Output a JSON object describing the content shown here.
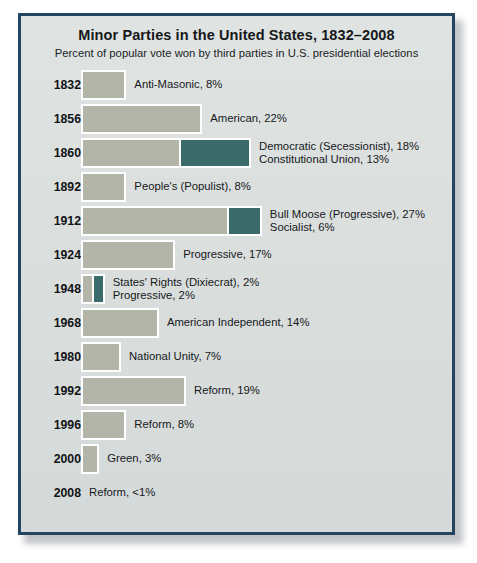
{
  "chart_data": {
    "type": "bar",
    "title": "Minor Parties in the United States, 1832–2008",
    "subtitle": "Percent of popular vote won by third parties in U.S. presidential elections",
    "xlabel": "",
    "ylabel": "",
    "orientation": "horizontal",
    "stacked": true,
    "grid": false,
    "legend": "none",
    "value_unit": "%",
    "xlim": [
      0,
      31
    ],
    "colors": {
      "primary_bar": "#b2b5a8",
      "secondary_bar": "#3a6a6a",
      "panel_background": "#dde2e1",
      "panel_border": "#24455f",
      "text": "#16181a"
    },
    "categories": [
      "1832",
      "1856",
      "1860",
      "1892",
      "1912",
      "1924",
      "1948",
      "1968",
      "1980",
      "1992",
      "1996",
      "2000",
      "2008"
    ],
    "rows": [
      {
        "year": "1832",
        "segments": [
          {
            "party": "Anti-Masonic",
            "value": 8,
            "color": "gray"
          }
        ],
        "labels": [
          "Anti-Masonic, 8%"
        ]
      },
      {
        "year": "1856",
        "segments": [
          {
            "party": "American",
            "value": 22,
            "color": "gray"
          }
        ],
        "labels": [
          "American, 22%"
        ]
      },
      {
        "year": "1860",
        "segments": [
          {
            "party": "Democratic (Secessionist)",
            "value": 18,
            "color": "gray"
          },
          {
            "party": "Constitutional Union",
            "value": 13,
            "color": "teal"
          }
        ],
        "labels": [
          "Democratic (Secessionist), 18%",
          "Constitutional Union, 13%"
        ]
      },
      {
        "year": "1892",
        "segments": [
          {
            "party": "People's (Populist)",
            "value": 8,
            "color": "gray"
          }
        ],
        "labels": [
          "People's (Populist), 8%"
        ]
      },
      {
        "year": "1912",
        "segments": [
          {
            "party": "Bull Moose (Progressive)",
            "value": 27,
            "color": "gray"
          },
          {
            "party": "Socialist",
            "value": 6,
            "color": "teal"
          }
        ],
        "labels": [
          "Bull Moose (Progressive), 27%",
          "Socialist, 6%"
        ]
      },
      {
        "year": "1924",
        "segments": [
          {
            "party": "Progressive",
            "value": 17,
            "color": "gray"
          }
        ],
        "labels": [
          "Progressive, 17%"
        ]
      },
      {
        "year": "1948",
        "segments": [
          {
            "party": "States' Rights (Dixiecrat)",
            "value": 2,
            "color": "gray"
          },
          {
            "party": "Progressive",
            "value": 2,
            "color": "teal"
          }
        ],
        "labels": [
          "States' Rights (Dixiecrat), 2%",
          "Progressive, 2%"
        ]
      },
      {
        "year": "1968",
        "segments": [
          {
            "party": "American Independent",
            "value": 14,
            "color": "gray"
          }
        ],
        "labels": [
          "American Independent, 14%"
        ]
      },
      {
        "year": "1980",
        "segments": [
          {
            "party": "National Unity",
            "value": 7,
            "color": "gray"
          }
        ],
        "labels": [
          "National Unity, 7%"
        ]
      },
      {
        "year": "1992",
        "segments": [
          {
            "party": "Reform",
            "value": 19,
            "color": "gray"
          }
        ],
        "labels": [
          "Reform, 19%"
        ]
      },
      {
        "year": "1996",
        "segments": [
          {
            "party": "Reform",
            "value": 8,
            "color": "gray"
          }
        ],
        "labels": [
          "Reform, 8%"
        ]
      },
      {
        "year": "2000",
        "segments": [
          {
            "party": "Green",
            "value": 3,
            "color": "gray"
          }
        ],
        "labels": [
          "Green, 3%"
        ]
      },
      {
        "year": "2008",
        "segments": [],
        "labels": [
          "Reform, <1%"
        ]
      }
    ]
  }
}
